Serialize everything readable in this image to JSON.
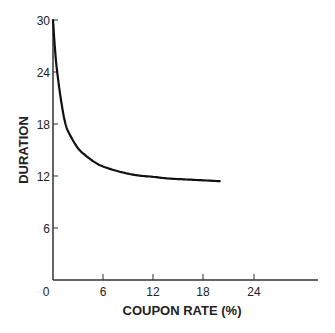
{
  "chart_data": {
    "type": "line",
    "title": "",
    "xlabel": "COUPON RATE (%)",
    "ylabel": "DURATION",
    "xlim": [
      0,
      30
    ],
    "ylim": [
      0,
      30
    ],
    "x_ticks": [
      0,
      6,
      12,
      18,
      24
    ],
    "y_ticks": [
      6,
      12,
      18,
      24,
      30
    ],
    "grid": false,
    "legend": null,
    "series": [
      {
        "name": "Duration vs Coupon Rate",
        "x": [
          0,
          0.25,
          0.5,
          1,
          1.5,
          2,
          3,
          4,
          5,
          6,
          8,
          10,
          12,
          14,
          16,
          18,
          20
        ],
        "y": [
          30,
          26.5,
          24,
          20.5,
          18,
          16.8,
          15.2,
          14.3,
          13.6,
          13.1,
          12.5,
          12.1,
          11.9,
          11.7,
          11.6,
          11.5,
          11.4
        ]
      }
    ]
  },
  "labels": {
    "xlabel": "COUPON RATE (%)",
    "ylabel": "DURATION",
    "origin": "0",
    "x_ticks": [
      "6",
      "12",
      "18",
      "24"
    ],
    "y_ticks": [
      "6",
      "12",
      "18",
      "24",
      "30"
    ]
  }
}
